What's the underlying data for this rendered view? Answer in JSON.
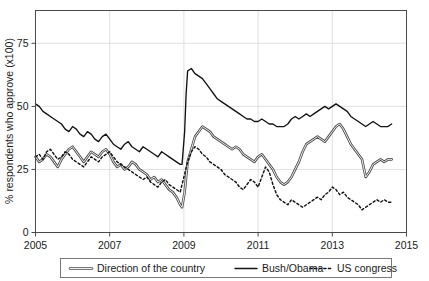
{
  "chart_data": {
    "type": "line",
    "title": "",
    "xlabel": "",
    "ylabel": "% respondents who approve (x100)",
    "xlim": [
      2005,
      2015
    ],
    "ylim": [
      0,
      88
    ],
    "xticks": [
      "2005",
      "2007",
      "2009",
      "2011",
      "2013",
      "2015"
    ],
    "xtick_values": [
      2005,
      2007,
      2009,
      2011,
      2013,
      2015
    ],
    "yticks": [
      "0",
      "25",
      "50",
      "75"
    ],
    "ytick_values": [
      0,
      25,
      50,
      75
    ],
    "grid": true,
    "legend_position": "below-plot",
    "series": [
      {
        "name": "Direction of the country",
        "style": "double-line",
        "color": "#4d4d4d",
        "x": [
          2005.0,
          2005.1,
          2005.2,
          2005.3,
          2005.4,
          2005.5,
          2005.6,
          2005.7,
          2005.8,
          2005.9,
          2006.0,
          2006.1,
          2006.2,
          2006.3,
          2006.4,
          2006.5,
          2006.6,
          2006.7,
          2006.8,
          2006.9,
          2007.0,
          2007.1,
          2007.2,
          2007.3,
          2007.4,
          2007.5,
          2007.6,
          2007.7,
          2007.8,
          2007.9,
          2008.0,
          2008.1,
          2008.2,
          2008.3,
          2008.4,
          2008.5,
          2008.6,
          2008.7,
          2008.8,
          2008.9,
          2008.95,
          2009.02,
          2009.06,
          2009.1,
          2009.2,
          2009.3,
          2009.4,
          2009.5,
          2009.6,
          2009.7,
          2009.8,
          2009.9,
          2010.0,
          2010.1,
          2010.2,
          2010.3,
          2010.4,
          2010.5,
          2010.6,
          2010.7,
          2010.8,
          2010.9,
          2011.0,
          2011.1,
          2011.2,
          2011.3,
          2011.4,
          2011.5,
          2011.6,
          2011.7,
          2011.8,
          2011.9,
          2012.0,
          2012.1,
          2012.2,
          2012.3,
          2012.4,
          2012.5,
          2012.6,
          2012.7,
          2012.8,
          2012.9,
          2013.0,
          2013.1,
          2013.2,
          2013.3,
          2013.4,
          2013.5,
          2013.6,
          2013.7,
          2013.8,
          2013.9,
          2014.0,
          2014.1,
          2014.2,
          2014.3,
          2014.4,
          2014.5,
          2014.6
        ],
        "values": [
          30,
          28,
          29,
          31,
          30,
          28,
          26,
          29,
          31,
          33,
          34,
          32,
          30,
          28,
          30,
          32,
          31,
          30,
          32,
          33,
          31,
          28,
          26,
          27,
          25,
          26,
          28,
          27,
          25,
          24,
          23,
          21,
          22,
          20,
          21,
          19,
          17,
          16,
          14,
          11,
          10,
          16,
          22,
          28,
          33,
          38,
          40,
          42,
          41,
          40,
          38,
          37,
          36,
          35,
          34,
          33,
          34,
          33,
          31,
          30,
          29,
          28,
          30,
          31,
          29,
          27,
          25,
          22,
          20,
          19,
          20,
          22,
          25,
          28,
          32,
          35,
          36,
          37,
          38,
          37,
          36,
          38,
          40,
          42,
          43,
          41,
          38,
          35,
          33,
          31,
          29,
          22,
          24,
          27,
          28,
          29,
          28,
          29,
          29
        ],
        "notes": "Sharp rise at January 2009 inauguration; trough near 10 in late 2008; second trough near 20 in 2011 and near 22 in late 2013."
      },
      {
        "name": "Bush/Obama",
        "style": "solid",
        "color": "#121212",
        "x": [
          2005.0,
          2005.1,
          2005.2,
          2005.3,
          2005.4,
          2005.5,
          2005.6,
          2005.7,
          2005.8,
          2005.9,
          2006.0,
          2006.1,
          2006.2,
          2006.3,
          2006.4,
          2006.5,
          2006.6,
          2006.7,
          2006.8,
          2006.9,
          2007.0,
          2007.1,
          2007.2,
          2007.3,
          2007.4,
          2007.5,
          2007.6,
          2007.7,
          2007.8,
          2007.9,
          2008.0,
          2008.1,
          2008.2,
          2008.3,
          2008.4,
          2008.5,
          2008.6,
          2008.7,
          2008.8,
          2008.9,
          2008.95,
          2009.02,
          2009.06,
          2009.1,
          2009.2,
          2009.3,
          2009.4,
          2009.5,
          2009.6,
          2009.7,
          2009.8,
          2009.9,
          2010.0,
          2010.1,
          2010.2,
          2010.3,
          2010.4,
          2010.5,
          2010.6,
          2010.7,
          2010.8,
          2010.9,
          2011.0,
          2011.1,
          2011.2,
          2011.3,
          2011.4,
          2011.5,
          2011.6,
          2011.7,
          2011.8,
          2011.9,
          2012.0,
          2012.1,
          2012.2,
          2012.3,
          2012.4,
          2012.5,
          2012.6,
          2012.7,
          2012.8,
          2012.9,
          2013.0,
          2013.1,
          2013.2,
          2013.3,
          2013.4,
          2013.5,
          2013.6,
          2013.7,
          2013.8,
          2013.9,
          2014.0,
          2014.1,
          2014.2,
          2014.3,
          2014.4,
          2014.5,
          2014.6
        ],
        "values": [
          51,
          50,
          48,
          47,
          46,
          45,
          44,
          43,
          41,
          40,
          42,
          41,
          39,
          38,
          40,
          39,
          37,
          36,
          38,
          39,
          37,
          35,
          34,
          33,
          35,
          36,
          34,
          33,
          32,
          34,
          33,
          32,
          31,
          30,
          32,
          31,
          30,
          29,
          28,
          27,
          27,
          40,
          55,
          64,
          65,
          63,
          62,
          61,
          59,
          57,
          55,
          53,
          52,
          51,
          50,
          49,
          48,
          47,
          46,
          45,
          45,
          44,
          44,
          45,
          44,
          43,
          43,
          42,
          42,
          42,
          43,
          45,
          46,
          45,
          46,
          47,
          46,
          47,
          48,
          49,
          50,
          49,
          50,
          51,
          50,
          49,
          48,
          46,
          45,
          44,
          43,
          42,
          43,
          44,
          43,
          42,
          42,
          42,
          43
        ],
        "notes": "Bush approval declining 51 to 27 through 2008; vertical jump at Jan 2009 to Obama honeymoon 65; settles in low-to-mid 40s."
      },
      {
        "name": "US congress",
        "style": "dotted",
        "color": "#121212",
        "x": [
          2005.0,
          2005.1,
          2005.2,
          2005.3,
          2005.4,
          2005.5,
          2005.6,
          2005.7,
          2005.8,
          2005.9,
          2006.0,
          2006.1,
          2006.2,
          2006.3,
          2006.4,
          2006.5,
          2006.6,
          2006.7,
          2006.8,
          2006.9,
          2007.0,
          2007.1,
          2007.2,
          2007.3,
          2007.4,
          2007.5,
          2007.6,
          2007.7,
          2007.8,
          2007.9,
          2008.0,
          2008.1,
          2008.2,
          2008.3,
          2008.4,
          2008.5,
          2008.6,
          2008.7,
          2008.8,
          2008.9,
          2009.0,
          2009.1,
          2009.2,
          2009.3,
          2009.4,
          2009.5,
          2009.6,
          2009.7,
          2009.8,
          2009.9,
          2010.0,
          2010.1,
          2010.2,
          2010.3,
          2010.4,
          2010.5,
          2010.6,
          2010.7,
          2010.8,
          2010.9,
          2011.0,
          2011.1,
          2011.2,
          2011.3,
          2011.4,
          2011.5,
          2011.6,
          2011.7,
          2011.8,
          2011.9,
          2012.0,
          2012.1,
          2012.2,
          2012.3,
          2012.4,
          2012.5,
          2012.6,
          2012.7,
          2012.8,
          2012.9,
          2013.0,
          2013.1,
          2013.2,
          2013.3,
          2013.4,
          2013.5,
          2013.6,
          2013.7,
          2013.8,
          2013.9,
          2014.0,
          2014.1,
          2014.2,
          2014.3,
          2014.4,
          2014.5,
          2014.6
        ],
        "values": [
          30,
          31,
          29,
          32,
          33,
          31,
          29,
          30,
          32,
          31,
          29,
          28,
          27,
          26,
          28,
          30,
          29,
          28,
          30,
          31,
          32,
          30,
          28,
          27,
          26,
          25,
          24,
          23,
          22,
          21,
          22,
          20,
          19,
          18,
          20,
          21,
          19,
          18,
          17,
          16,
          22,
          28,
          32,
          34,
          33,
          31,
          30,
          28,
          27,
          26,
          25,
          23,
          22,
          21,
          20,
          18,
          17,
          19,
          21,
          20,
          18,
          22,
          26,
          24,
          19,
          15,
          13,
          12,
          11,
          13,
          12,
          11,
          10,
          11,
          12,
          13,
          14,
          13,
          15,
          16,
          18,
          17,
          15,
          16,
          14,
          13,
          12,
          11,
          9,
          10,
          11,
          12,
          13,
          12,
          13,
          12,
          12
        ],
        "notes": "Congressional approval trending downward from ~30 to low teens; local peak near 34 in mid 2009."
      }
    ]
  },
  "legend": {
    "items": [
      {
        "label": "Direction of the country",
        "style": "double-line"
      },
      {
        "label": "Bush/Obama",
        "style": "solid"
      },
      {
        "label": "US congress",
        "style": "dotted"
      }
    ]
  }
}
